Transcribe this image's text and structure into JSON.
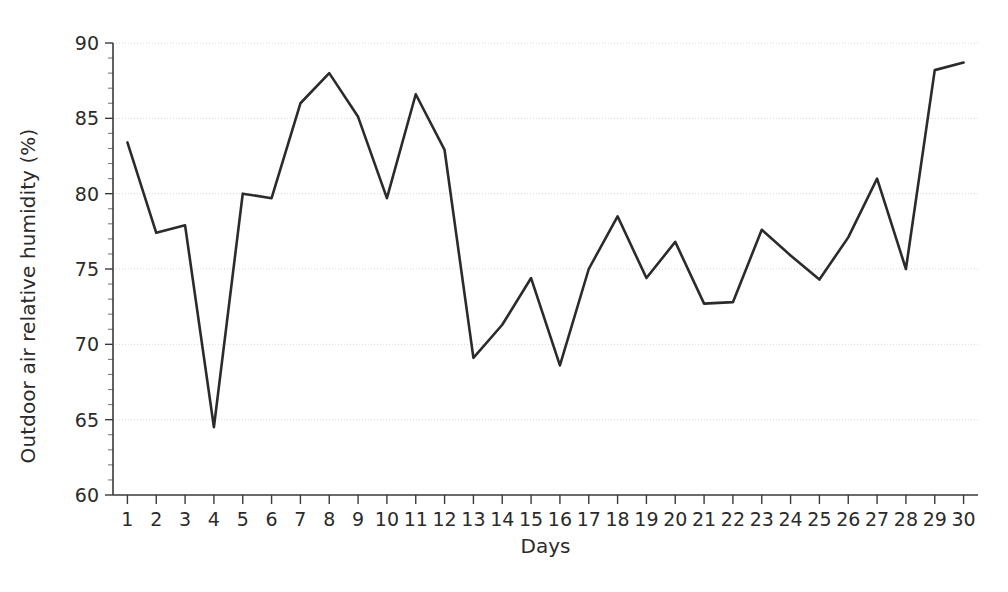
{
  "chart_data": {
    "type": "line",
    "title": "",
    "subtitle": "",
    "xlabel": "Days",
    "ylabel": "Outdoor air relative humidity (%)",
    "xlim": [
      0.5,
      30.5
    ],
    "ylim": [
      60,
      90
    ],
    "y_major_ticks": [
      60,
      65,
      70,
      75,
      80,
      85,
      90
    ],
    "y_minor_tick_step": 1,
    "x_tick_labels": [
      "1",
      "2",
      "3",
      "4",
      "5",
      "6",
      "7",
      "8",
      "9",
      "10",
      "11",
      "12",
      "13",
      "14",
      "15",
      "16",
      "17",
      "18",
      "19",
      "20",
      "21",
      "22",
      "23",
      "24",
      "25",
      "26",
      "27",
      "28",
      "29",
      "30"
    ],
    "grid": "horizontal-dotted-major",
    "legend": "none",
    "line_color": "#2b2b2b",
    "background_color": "#ffffff",
    "grid_color": "#d8d8d8",
    "x": [
      1,
      2,
      3,
      4,
      5,
      6,
      7,
      8,
      9,
      10,
      11,
      12,
      13,
      14,
      15,
      16,
      17,
      18,
      19,
      20,
      21,
      22,
      23,
      24,
      25,
      26,
      27,
      28,
      29,
      30
    ],
    "values": [
      83.4,
      77.4,
      77.9,
      64.5,
      80.0,
      79.7,
      86.0,
      88.0,
      85.1,
      79.7,
      86.6,
      82.9,
      69.1,
      71.3,
      74.4,
      68.6,
      75.0,
      78.5,
      74.4,
      76.8,
      72.7,
      72.8,
      77.6,
      75.9,
      74.3,
      77.1,
      81.0,
      75.0,
      88.2,
      88.7
    ],
    "series": [
      {
        "name": "Outdoor air relative humidity",
        "values": [
          83.4,
          77.4,
          77.9,
          64.5,
          80.0,
          79.7,
          86.0,
          88.0,
          85.1,
          79.7,
          86.6,
          82.9,
          69.1,
          71.3,
          74.4,
          68.6,
          75.0,
          78.5,
          74.4,
          76.8,
          72.7,
          72.8,
          77.6,
          75.9,
          74.3,
          77.1,
          81.0,
          75.0,
          88.2,
          88.7
        ]
      }
    ]
  },
  "axes": {
    "y_title": "Outdoor air relative humidity (%)",
    "x_title": "Days"
  }
}
